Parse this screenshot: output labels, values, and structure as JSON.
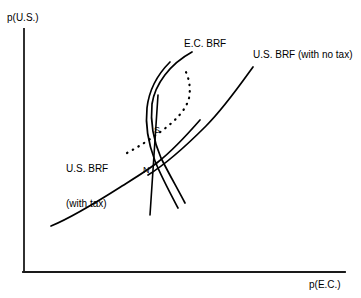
{
  "figure": {
    "axes": {
      "y_label": "p(U.S.)",
      "x_label": "p(E.C.)"
    },
    "curve_labels": {
      "ec_brf": "E.C. BRF",
      "us_brf_no_tax": "U.S. BRF (with no tax)",
      "us_brf_tax_line1": "U.S. BRF",
      "us_brf_tax_line2": "(with tax)"
    },
    "point_labels": {
      "s": "S",
      "n": "N"
    },
    "colors": {
      "ink": "#000000",
      "background": "#ffffff"
    }
  },
  "chart_data": {
    "type": "line",
    "title": "",
    "xlabel": "p(E.C.)",
    "ylabel": "p(U.S.)",
    "grid": false,
    "legend": "inline-annotations",
    "axis_pixels": {
      "x_axis_y": 272,
      "x_axis_from": 23,
      "x_axis_to": 345,
      "y_axis_x": 24,
      "y_axis_from": 29,
      "y_axis_to": 272
    },
    "annotations": [
      {
        "text": "E.C. BRF",
        "x": 184,
        "y": 38
      },
      {
        "text": "U.S. BRF (with no tax)",
        "x": 253,
        "y": 49
      },
      {
        "text": "U.S. BRF (with tax)",
        "x": 66,
        "y": 140
      },
      {
        "text": "S",
        "x": 154,
        "y": 125
      },
      {
        "text": "N",
        "x": 143,
        "y": 165
      }
    ],
    "series": [
      {
        "name": "U.S. BRF (with tax)",
        "style": "solid",
        "path": "M 51 226 C 75 216, 100 200, 122 186 C 138 176, 148 170, 158 162 C 172 151, 186 136, 200 120"
      },
      {
        "name": "U.S. BRF (with no tax)",
        "style": "solid",
        "path": "M 148 175 C 166 164, 186 146, 206 126 C 224 108, 240 85, 253 67"
      },
      {
        "name": "E.C. BRF (outer)",
        "style": "solid",
        "path": "M 185 203 C 176 186, 168 172, 161 158 C 154 142, 150 124, 152 104 C 155 84, 170 64, 192 52"
      },
      {
        "name": "E.C. BRF (inner)",
        "style": "solid",
        "path": "M 178 208 C 169 191, 161 176, 155 161 C 149 145, 145 126, 147 108 C 149 90, 158 74, 170 62"
      },
      {
        "name": "E.C. BRF (steep straight)",
        "style": "solid",
        "path": "M 150 215 L 158 95"
      },
      {
        "name": "reaction path",
        "style": "dotted",
        "path": "M 127 153 C 140 146, 152 138, 163 130 C 176 120, 186 110, 189 98 C 191 88, 189 78, 185 70"
      }
    ]
  }
}
